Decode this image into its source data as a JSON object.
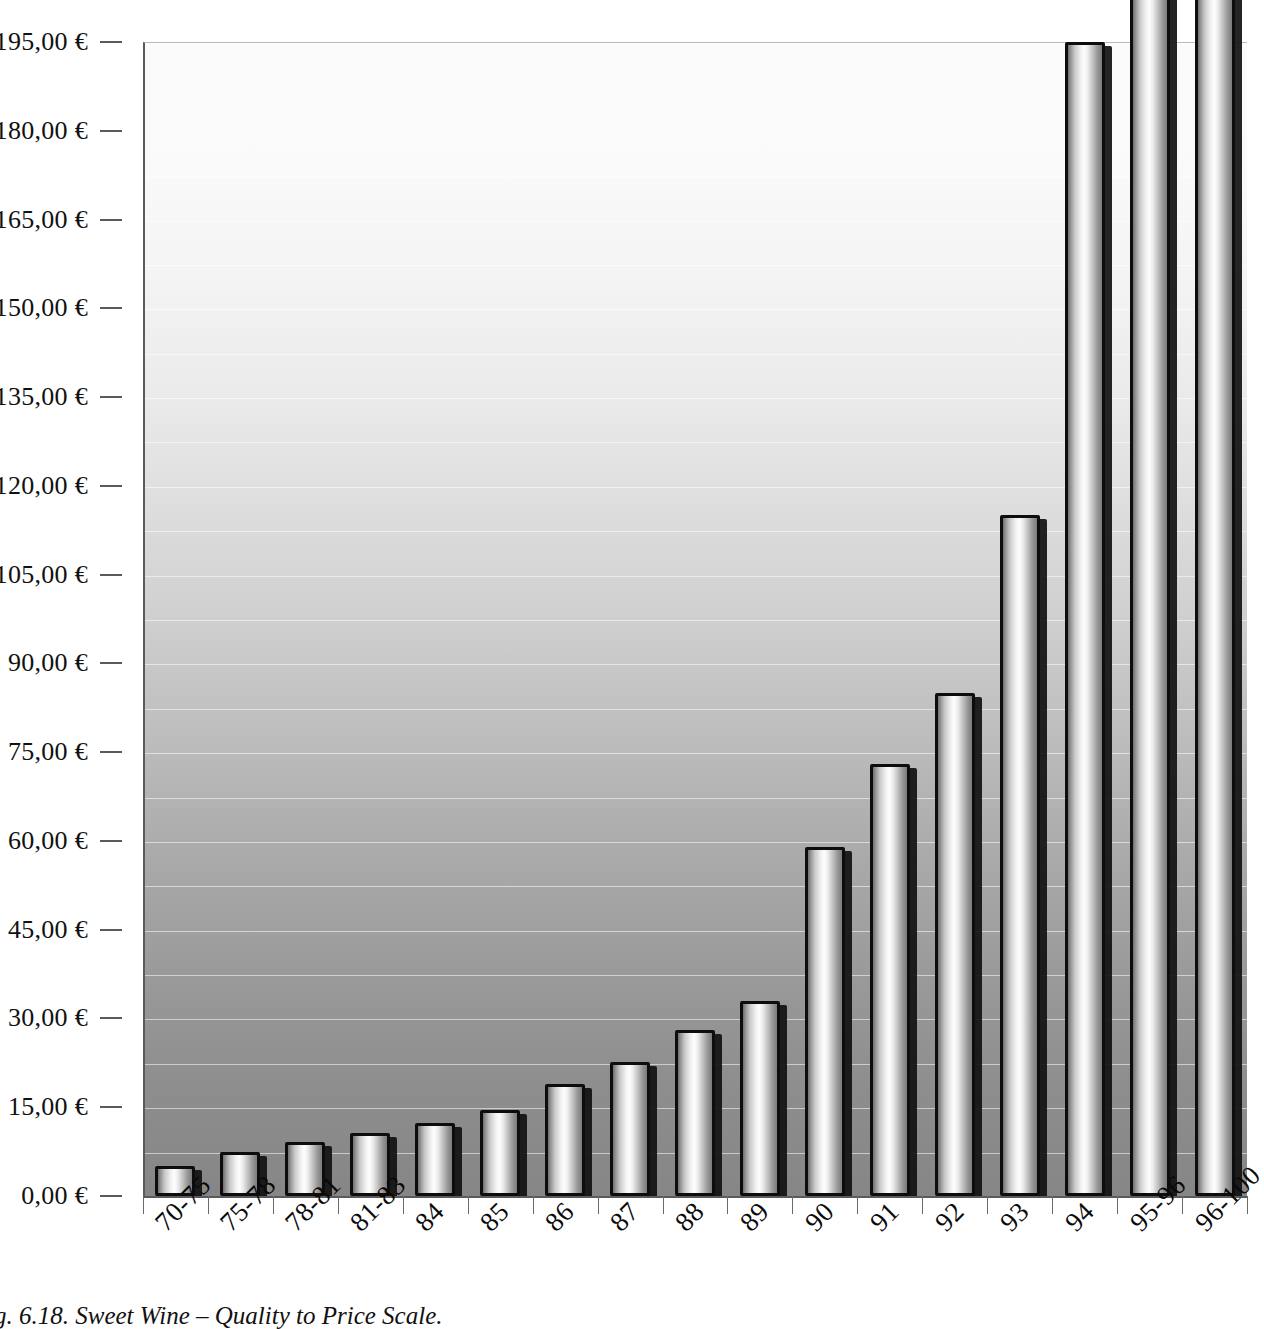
{
  "caption": "g. 6.18. Sweet Wine – Quality to Price Scale.",
  "colors": {
    "plot_top": "#fbfbfb",
    "plot_bottom": "#868686",
    "bar_outline": "#0d0d0d",
    "bar_highlight": "#fdfdfd",
    "axis": "#5a5a5a",
    "gridline": "#ffffff"
  },
  "chart_data": {
    "type": "bar",
    "title": "",
    "subtitle": "",
    "xlabel": "",
    "ylabel": "",
    "categories": [
      "70-75",
      "75-78",
      "78-81",
      "81-83",
      "84",
      "85",
      "86",
      "87",
      "88",
      "89",
      "90",
      "91",
      "92",
      "93",
      "94",
      "95-96",
      "96-100"
    ],
    "values": [
      5.0,
      7.5,
      9.2,
      10.6,
      12.4,
      14.6,
      19.0,
      22.6,
      28.0,
      33.0,
      59.0,
      73.0,
      85.0,
      115.0,
      195.0,
      215.0,
      212.0
    ],
    "value_unit": "€",
    "ylim": [
      0,
      195
    ],
    "ytick_step": 15,
    "ytick_labels": [
      "0,00 €",
      "15,00 €",
      "30,00 €",
      "45,00 €",
      "60,00 €",
      "75,00 €",
      "90,00 €",
      "105,00 €",
      "120,00 €",
      "135,00 €",
      "150,00 €",
      "165,00 €",
      "180,00 €",
      "195,00 €"
    ],
    "ytick_values": [
      0,
      15,
      30,
      45,
      60,
      75,
      90,
      105,
      120,
      135,
      150,
      165,
      180,
      195
    ],
    "minor_gridline_step": 7.5,
    "grid": true,
    "legend": null,
    "legend_position": "none",
    "clipped_categories": [
      "95-96",
      "96-100"
    ],
    "xtick_label_rotation": -45
  }
}
